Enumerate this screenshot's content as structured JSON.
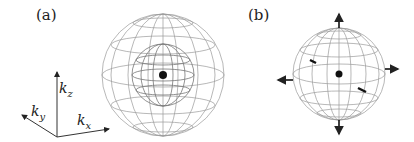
{
  "panels": [
    {
      "label": "(a)",
      "description": "Nested wireframe spheres with central dot"
    },
    {
      "label": "(b)",
      "description": "Wireframe sphere with central dot and outward arrows"
    }
  ],
  "axes": {
    "kz": {
      "base": "k",
      "sub": "z"
    },
    "ky": {
      "base": "k",
      "sub": "y"
    },
    "kx": {
      "base": "k",
      "sub": "x"
    }
  }
}
